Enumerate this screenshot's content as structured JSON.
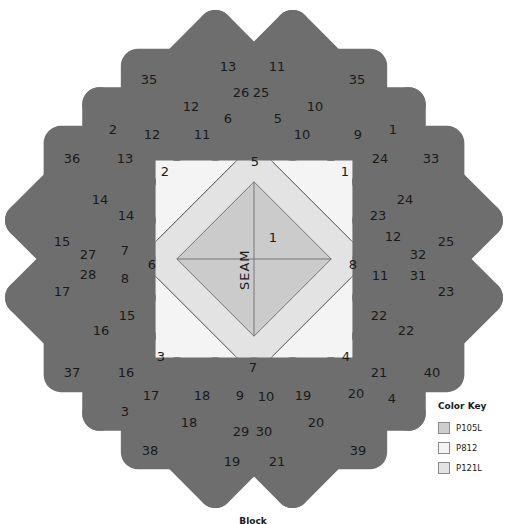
{
  "colors": {
    "P105L": "#cdcdcd",
    "P812": "#f4f4f4",
    "P121L": "#e3e3e3",
    "outline": "#6e6e6e"
  },
  "diagram": {
    "center_label": "SEAM",
    "inner_labels": [
      {
        "text": "1",
        "x": 273,
        "y": 238
      },
      {
        "text": "2",
        "x": 165,
        "y": 172
      },
      {
        "text": "5",
        "x": 255,
        "y": 162
      },
      {
        "text": "1",
        "x": 345,
        "y": 172
      },
      {
        "text": "6",
        "x": 152,
        "y": 265
      },
      {
        "text": "8",
        "x": 353,
        "y": 265
      },
      {
        "text": "3",
        "x": 161,
        "y": 357
      },
      {
        "text": "7",
        "x": 253,
        "y": 368
      },
      {
        "text": "4",
        "x": 346,
        "y": 357
      }
    ],
    "outer_labels": [
      {
        "text": "35",
        "x": 149,
        "y": 80
      },
      {
        "text": "13",
        "x": 228,
        "y": 67
      },
      {
        "text": "11",
        "x": 277,
        "y": 67
      },
      {
        "text": "35",
        "x": 357,
        "y": 80
      },
      {
        "text": "26",
        "x": 241,
        "y": 93
      },
      {
        "text": "25",
        "x": 261,
        "y": 93
      },
      {
        "text": "12",
        "x": 191,
        "y": 107
      },
      {
        "text": "10",
        "x": 315,
        "y": 107
      },
      {
        "text": "2",
        "x": 113,
        "y": 130
      },
      {
        "text": "6",
        "x": 228,
        "y": 119
      },
      {
        "text": "5",
        "x": 278,
        "y": 119
      },
      {
        "text": "1",
        "x": 393,
        "y": 130
      },
      {
        "text": "12",
        "x": 152,
        "y": 135
      },
      {
        "text": "11",
        "x": 202,
        "y": 135
      },
      {
        "text": "10",
        "x": 302,
        "y": 135
      },
      {
        "text": "9",
        "x": 358,
        "y": 135
      },
      {
        "text": "36",
        "x": 72,
        "y": 159
      },
      {
        "text": "13",
        "x": 125,
        "y": 159
      },
      {
        "text": "24",
        "x": 380,
        "y": 159
      },
      {
        "text": "33",
        "x": 431,
        "y": 159
      },
      {
        "text": "14",
        "x": 100,
        "y": 200
      },
      {
        "text": "24",
        "x": 405,
        "y": 200
      },
      {
        "text": "14",
        "x": 126,
        "y": 216
      },
      {
        "text": "23",
        "x": 378,
        "y": 216
      },
      {
        "text": "15",
        "x": 62,
        "y": 242
      },
      {
        "text": "12",
        "x": 393,
        "y": 237
      },
      {
        "text": "25",
        "x": 446,
        "y": 242
      },
      {
        "text": "27",
        "x": 88,
        "y": 255
      },
      {
        "text": "7",
        "x": 125,
        "y": 251
      },
      {
        "text": "32",
        "x": 418,
        "y": 255
      },
      {
        "text": "28",
        "x": 88,
        "y": 275
      },
      {
        "text": "8",
        "x": 125,
        "y": 279
      },
      {
        "text": "11",
        "x": 380,
        "y": 276
      },
      {
        "text": "31",
        "x": 418,
        "y": 276
      },
      {
        "text": "17",
        "x": 62,
        "y": 292
      },
      {
        "text": "23",
        "x": 446,
        "y": 292
      },
      {
        "text": "15",
        "x": 127,
        "y": 316
      },
      {
        "text": "22",
        "x": 379,
        "y": 316
      },
      {
        "text": "16",
        "x": 101,
        "y": 331
      },
      {
        "text": "22",
        "x": 406,
        "y": 331
      },
      {
        "text": "37",
        "x": 72,
        "y": 373
      },
      {
        "text": "16",
        "x": 126,
        "y": 373
      },
      {
        "text": "21",
        "x": 379,
        "y": 373
      },
      {
        "text": "40",
        "x": 432,
        "y": 373
      },
      {
        "text": "17",
        "x": 151,
        "y": 396
      },
      {
        "text": "18",
        "x": 202,
        "y": 396
      },
      {
        "text": "9",
        "x": 240,
        "y": 396
      },
      {
        "text": "10",
        "x": 266,
        "y": 397
      },
      {
        "text": "19",
        "x": 303,
        "y": 396
      },
      {
        "text": "20",
        "x": 356,
        "y": 394
      },
      {
        "text": "3",
        "x": 125,
        "y": 412
      },
      {
        "text": "4",
        "x": 392,
        "y": 399
      },
      {
        "text": "18",
        "x": 189,
        "y": 423
      },
      {
        "text": "20",
        "x": 316,
        "y": 423
      },
      {
        "text": "29",
        "x": 241,
        "y": 432
      },
      {
        "text": "30",
        "x": 264,
        "y": 432
      },
      {
        "text": "38",
        "x": 150,
        "y": 451
      },
      {
        "text": "39",
        "x": 358,
        "y": 451
      },
      {
        "text": "19",
        "x": 232,
        "y": 462
      },
      {
        "text": "21",
        "x": 277,
        "y": 462
      }
    ]
  },
  "color_key": {
    "title": "Color Key",
    "items": [
      {
        "label": "P105L",
        "color": "#cdcdcd"
      },
      {
        "label": "P812",
        "color": "#f4f4f4"
      },
      {
        "label": "P121L",
        "color": "#e3e3e3"
      }
    ]
  },
  "caption": "Block"
}
